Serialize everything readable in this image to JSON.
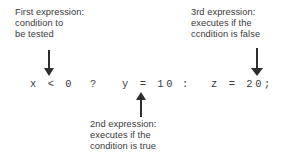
{
  "figure": {
    "background_color": "#ffffff",
    "text_color": "#3a3a3a",
    "arrow_color": "#2e2e2e"
  },
  "code": {
    "full_expression": "x < 0 ? y = 10 : z = 20;",
    "tokens": {
      "condition": "x < 0",
      "question_mark": "?",
      "true_branch": "y = 10",
      "colon": ":",
      "false_branch": "z = 20;"
    }
  },
  "annotations": {
    "first": {
      "line1": "First expression:",
      "line2": "condition to",
      "line3": "be tested",
      "arrow_direction": "down"
    },
    "second": {
      "line1": "2nd expression:",
      "line2": "executes if the",
      "line3": "condition is true",
      "arrow_direction": "up"
    },
    "third": {
      "line1": "3rd expression:",
      "line2": "executes if the",
      "line3": "ccndition is false",
      "arrow_direction": "down"
    }
  }
}
